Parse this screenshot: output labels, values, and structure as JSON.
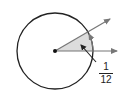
{
  "diagram": {
    "type": "circle-angle",
    "label": {
      "numerator": "1",
      "denominator": "12"
    },
    "colors": {
      "stroke": "#222222",
      "ray": "#777777",
      "shade": "#d9d9d9"
    }
  }
}
